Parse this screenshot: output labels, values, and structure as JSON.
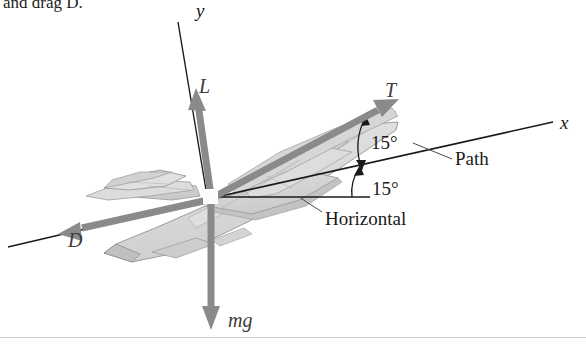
{
  "figure": {
    "caption_fragment": "and drag D.",
    "background_color": "#ffffff",
    "width": 586,
    "height": 350
  },
  "colors": {
    "vector_gray": "#8a8a8a",
    "vector_gray_dark": "#6f6f6f",
    "aircraft_fill": "#d9d9d9",
    "aircraft_fill_light": "#e4e4e4",
    "aircraft_fill_dark": "#c6c6c6",
    "aircraft_stroke": "#9a9a9a",
    "axis_black": "#1a1a1a",
    "label_dark": "#1a1a1a",
    "rule_gray": "#b8b8b8"
  },
  "axes": [
    {
      "name": "y-axis",
      "label": "y",
      "style": "thin-black-line",
      "label_x": 196,
      "label_y": 6
    },
    {
      "name": "x-axis",
      "label": "x",
      "style": "thin-black-line",
      "label_x": 560,
      "label_y": 113
    }
  ],
  "forces": [
    {
      "name": "lift",
      "label": "L",
      "direction": "up",
      "color": "#8a8a8a",
      "label_x": 199,
      "label_y": 78
    },
    {
      "name": "thrust",
      "label": "T",
      "direction": "up-right-along-fuselage",
      "color": "#8a8a8a",
      "label_x": 385,
      "label_y": 82
    },
    {
      "name": "drag",
      "label": "D",
      "direction": "down-left-along-fuselage",
      "color": "#8a8a8a",
      "label_x": 70,
      "label_y": 233
    },
    {
      "name": "weight",
      "label": "mg",
      "direction": "down",
      "color": "#8a8a8a",
      "label_x": 228,
      "label_y": 313
    }
  ],
  "angles": [
    {
      "name": "angle-of-attack",
      "value": "15°",
      "between": "fuselage-axis and flight-path",
      "label_x": 371,
      "label_y": 135
    },
    {
      "name": "flight-path-angle",
      "value": "15°",
      "between": "flight-path and horizontal",
      "label_x": 372,
      "label_y": 181
    }
  ],
  "annotations": [
    {
      "name": "path-label",
      "text": "Path",
      "label_x": 455,
      "label_y": 159,
      "leader": "from upper-left to flight-path line"
    },
    {
      "name": "horizontal-label",
      "text": "Horizontal",
      "label_x": 325,
      "label_y": 218,
      "leader": "from upper-left to horizontal reference line"
    }
  ],
  "aircraft": {
    "name": "fighter-jet",
    "orientation": "nose-up-right, 3/4 rear view",
    "fill": "#d9d9d9"
  },
  "origin": {
    "name": "force-application-point",
    "x": 209,
    "y": 196,
    "marker": "white-square"
  }
}
